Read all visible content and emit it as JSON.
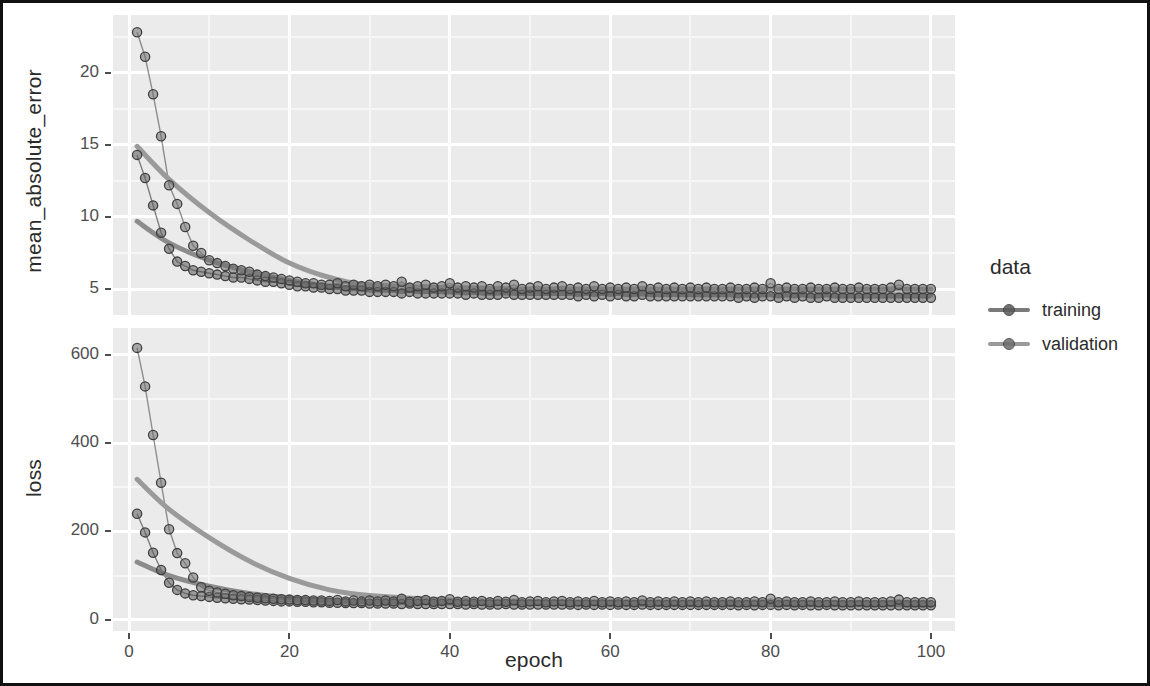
{
  "figure": {
    "x_axis_title": "epoch",
    "legend_title": "data"
  },
  "panels": {
    "top": {
      "y_axis_title": "mean_absolute_error"
    },
    "bottom": {
      "y_axis_title": "loss"
    }
  },
  "legend": {
    "title": "data",
    "entries": [
      {
        "label": "training",
        "color": "#7a7a7a",
        "point_color": "#5a5a5a"
      },
      {
        "label": "validation",
        "color": "#9a9a9a",
        "point_color": "#6e6e6e"
      }
    ]
  },
  "chart_data": {
    "type": "scatter",
    "title": "",
    "subtitle": "",
    "xlabel": "epoch",
    "facets": [
      {
        "name": "mean_absolute_error",
        "ylabel": "mean_absolute_error",
        "ylim": [
          3.2,
          24.0
        ],
        "yticks": [
          5,
          10,
          15,
          20
        ],
        "ytick_labels": [
          "5",
          "10",
          "15",
          "20"
        ],
        "yminor": [
          7.5,
          12.5,
          17.5,
          22.5
        ],
        "series": [
          {
            "name": "training",
            "color": "#5a5a5a",
            "smooth_color": "#8c8c8c",
            "x": [
              1,
              2,
              3,
              4,
              5,
              6,
              7,
              8,
              9,
              10,
              11,
              12,
              13,
              14,
              15,
              16,
              17,
              18,
              19,
              20,
              21,
              22,
              23,
              24,
              25,
              26,
              27,
              28,
              29,
              30,
              31,
              32,
              33,
              34,
              35,
              36,
              37,
              38,
              39,
              40,
              41,
              42,
              43,
              44,
              45,
              46,
              47,
              48,
              49,
              50,
              51,
              52,
              53,
              54,
              55,
              56,
              57,
              58,
              59,
              60,
              61,
              62,
              63,
              64,
              65,
              66,
              67,
              68,
              69,
              70,
              71,
              72,
              73,
              74,
              75,
              76,
              77,
              78,
              79,
              80,
              81,
              82,
              83,
              84,
              85,
              86,
              87,
              88,
              89,
              90,
              91,
              92,
              93,
              94,
              95,
              96,
              97,
              98,
              99,
              100
            ],
            "y": [
              14.3,
              12.7,
              10.8,
              8.9,
              7.8,
              6.9,
              6.6,
              6.3,
              6.2,
              6.1,
              6.0,
              5.9,
              5.8,
              5.8,
              5.7,
              5.6,
              5.5,
              5.5,
              5.4,
              5.3,
              5.2,
              5.2,
              5.1,
              5.1,
              5.0,
              5.0,
              4.9,
              4.9,
              4.9,
              4.8,
              4.8,
              4.8,
              4.8,
              4.7,
              4.8,
              4.7,
              4.7,
              4.7,
              4.7,
              4.7,
              4.7,
              4.6,
              4.7,
              4.6,
              4.6,
              4.6,
              4.7,
              4.6,
              4.6,
              4.6,
              4.6,
              4.6,
              4.6,
              4.6,
              4.6,
              4.5,
              4.6,
              4.5,
              4.6,
              4.5,
              4.6,
              4.5,
              4.5,
              4.6,
              4.5,
              4.5,
              4.5,
              4.5,
              4.5,
              4.5,
              4.5,
              4.5,
              4.5,
              4.5,
              4.5,
              4.4,
              4.5,
              4.4,
              4.5,
              4.5,
              4.4,
              4.5,
              4.4,
              4.5,
              4.4,
              4.4,
              4.5,
              4.4,
              4.4,
              4.4,
              4.4,
              4.4,
              4.4,
              4.4,
              4.4,
              4.4,
              4.4,
              4.4,
              4.4,
              4.4
            ],
            "smooth_x": [
              1,
              5,
              10,
              15,
              20,
              25,
              30,
              40,
              50,
              60,
              70,
              80,
              90,
              100
            ],
            "smooth_y": [
              9.7,
              8.2,
              7.0,
              6.2,
              5.6,
              5.2,
              5.0,
              4.8,
              4.7,
              4.7,
              4.6,
              4.6,
              4.6,
              4.6
            ]
          },
          {
            "name": "validation",
            "color": "#6e6e6e",
            "smooth_color": "#9a9a9a",
            "x": [
              1,
              2,
              3,
              4,
              5,
              6,
              7,
              8,
              9,
              10,
              11,
              12,
              13,
              14,
              15,
              16,
              17,
              18,
              19,
              20,
              21,
              22,
              23,
              24,
              25,
              26,
              27,
              28,
              29,
              30,
              31,
              32,
              33,
              34,
              35,
              36,
              37,
              38,
              39,
              40,
              41,
              42,
              43,
              44,
              45,
              46,
              47,
              48,
              49,
              50,
              51,
              52,
              53,
              54,
              55,
              56,
              57,
              58,
              59,
              60,
              61,
              62,
              63,
              64,
              65,
              66,
              67,
              68,
              69,
              70,
              71,
              72,
              73,
              74,
              75,
              76,
              77,
              78,
              79,
              80,
              81,
              82,
              83,
              84,
              85,
              86,
              87,
              88,
              89,
              90,
              91,
              92,
              93,
              94,
              95,
              96,
              97,
              98,
              99,
              100
            ],
            "y": [
              22.8,
              21.1,
              18.5,
              15.6,
              12.2,
              10.9,
              9.3,
              8.0,
              7.5,
              7.0,
              6.8,
              6.6,
              6.4,
              6.3,
              6.2,
              6.0,
              5.9,
              5.8,
              5.7,
              5.6,
              5.5,
              5.4,
              5.4,
              5.3,
              5.3,
              5.4,
              5.2,
              5.3,
              5.2,
              5.3,
              5.2,
              5.3,
              5.2,
              5.5,
              5.1,
              5.2,
              5.3,
              5.1,
              5.2,
              5.4,
              5.1,
              5.2,
              5.1,
              5.2,
              5.0,
              5.2,
              5.1,
              5.3,
              5.0,
              5.1,
              5.2,
              5.0,
              5.1,
              5.2,
              5.0,
              5.1,
              5.0,
              5.2,
              5.0,
              5.1,
              5.0,
              5.1,
              5.0,
              5.2,
              5.0,
              5.1,
              5.0,
              5.1,
              5.0,
              5.1,
              5.0,
              5.1,
              5.0,
              5.0,
              5.1,
              5.0,
              5.0,
              5.1,
              5.0,
              5.4,
              5.0,
              5.1,
              5.0,
              5.0,
              5.1,
              5.0,
              5.0,
              5.1,
              5.0,
              5.0,
              5.1,
              5.0,
              5.0,
              5.0,
              5.1,
              5.3,
              5.0,
              5.0,
              5.0,
              5.0
            ],
            "smooth_x": [
              1,
              5,
              10,
              15,
              20,
              25,
              30,
              40,
              50,
              60,
              70,
              80,
              90,
              100
            ],
            "smooth_y": [
              14.9,
              12.6,
              10.3,
              8.4,
              6.8,
              5.8,
              5.3,
              5.1,
              5.0,
              5.0,
              5.0,
              5.0,
              5.0,
              5.0
            ]
          }
        ]
      },
      {
        "name": "loss",
        "ylabel": "loss",
        "ylim": [
          -25,
          660
        ],
        "yticks": [
          0,
          200,
          400,
          600
        ],
        "ytick_labels": [
          "0",
          "200",
          "400",
          "600"
        ],
        "yminor": [
          100,
          300,
          500
        ],
        "series": [
          {
            "name": "training",
            "color": "#5a5a5a",
            "smooth_color": "#8c8c8c",
            "x": [
              1,
              2,
              3,
              4,
              5,
              6,
              7,
              8,
              9,
              10,
              11,
              12,
              13,
              14,
              15,
              16,
              17,
              18,
              19,
              20,
              21,
              22,
              23,
              24,
              25,
              26,
              27,
              28,
              29,
              30,
              31,
              32,
              33,
              34,
              35,
              36,
              37,
              38,
              39,
              40,
              41,
              42,
              43,
              44,
              45,
              46,
              47,
              48,
              49,
              50,
              51,
              52,
              53,
              54,
              55,
              56,
              57,
              58,
              59,
              60,
              61,
              62,
              63,
              64,
              65,
              66,
              67,
              68,
              69,
              70,
              71,
              72,
              73,
              74,
              75,
              76,
              77,
              78,
              79,
              80,
              81,
              82,
              83,
              84,
              85,
              86,
              87,
              88,
              89,
              90,
              91,
              92,
              93,
              94,
              95,
              96,
              97,
              98,
              99,
              100
            ],
            "y": [
              240,
              198,
              152,
              113,
              84,
              68,
              60,
              56,
              54,
              52,
              50,
              49,
              48,
              47,
              46,
              45,
              44,
              43,
              42,
              42,
              41,
              41,
              40,
              40,
              39,
              39,
              38,
              38,
              38,
              37,
              37,
              37,
              37,
              36,
              37,
              36,
              36,
              36,
              36,
              36,
              36,
              35,
              36,
              35,
              35,
              35,
              36,
              35,
              35,
              35,
              35,
              35,
              35,
              35,
              35,
              34,
              35,
              34,
              35,
              34,
              35,
              34,
              34,
              35,
              34,
              34,
              34,
              34,
              34,
              34,
              34,
              34,
              34,
              34,
              34,
              33,
              34,
              33,
              34,
              34,
              33,
              34,
              33,
              34,
              33,
              33,
              34,
              33,
              33,
              33,
              33,
              33,
              33,
              33,
              33,
              33,
              33,
              33,
              33,
              33
            ],
            "smooth_x": [
              1,
              5,
              10,
              15,
              20,
              25,
              30,
              40,
              50,
              60,
              70,
              80,
              90,
              100
            ],
            "smooth_y": [
              131,
              100,
              76,
              60,
              50,
              44,
              41,
              38,
              37,
              36,
              35,
              35,
              35,
              34
            ]
          },
          {
            "name": "validation",
            "color": "#6e6e6e",
            "smooth_color": "#9a9a9a",
            "x": [
              1,
              2,
              3,
              4,
              5,
              6,
              7,
              8,
              9,
              10,
              11,
              12,
              13,
              14,
              15,
              16,
              17,
              18,
              19,
              20,
              21,
              22,
              23,
              24,
              25,
              26,
              27,
              28,
              29,
              30,
              31,
              32,
              33,
              34,
              35,
              36,
              37,
              38,
              39,
              40,
              41,
              42,
              43,
              44,
              45,
              46,
              47,
              48,
              49,
              50,
              51,
              52,
              53,
              54,
              55,
              56,
              57,
              58,
              59,
              60,
              61,
              62,
              63,
              64,
              65,
              66,
              67,
              68,
              69,
              70,
              71,
              72,
              73,
              74,
              75,
              76,
              77,
              78,
              79,
              80,
              81,
              82,
              83,
              84,
              85,
              86,
              87,
              88,
              89,
              90,
              91,
              92,
              93,
              94,
              95,
              96,
              97,
              98,
              99,
              100
            ],
            "y": [
              615,
              528,
              418,
              310,
              205,
              151,
              128,
              96,
              74,
              66,
              62,
              59,
              56,
              54,
              52,
              50,
              49,
              48,
              47,
              46,
              45,
              45,
              44,
              44,
              43,
              45,
              42,
              44,
              42,
              44,
              42,
              44,
              42,
              48,
              41,
              43,
              45,
              41,
              43,
              47,
              41,
              43,
              41,
              43,
              40,
              43,
              41,
              45,
              40,
              42,
              43,
              40,
              42,
              43,
              40,
              42,
              40,
              43,
              40,
              42,
              40,
              42,
              40,
              44,
              40,
              42,
              40,
              42,
              40,
              42,
              40,
              42,
              40,
              40,
              42,
              40,
              40,
              42,
              40,
              48,
              40,
              42,
              40,
              40,
              42,
              40,
              40,
              42,
              40,
              40,
              42,
              40,
              40,
              40,
              42,
              46,
              40,
              40,
              40,
              40
            ],
            "smooth_x": [
              1,
              5,
              10,
              15,
              20,
              25,
              30,
              40,
              50,
              60,
              70,
              80,
              90,
              100
            ],
            "smooth_y": [
              318,
              250,
              186,
              133,
              94,
              68,
              55,
              45,
              42,
              41,
              41,
              41,
              40,
              40
            ]
          }
        ]
      }
    ],
    "xlim": [
      -2,
      103
    ],
    "xticks": [
      0,
      20,
      40,
      60,
      80,
      100
    ],
    "xtick_labels": [
      "0",
      "20",
      "40",
      "60",
      "80",
      "100"
    ],
    "xminor": [
      10,
      30,
      50,
      70,
      90
    ],
    "grid": true,
    "legend_position": "right",
    "panel_background": "#ebebeb",
    "gridline_color": "#ffffff"
  }
}
